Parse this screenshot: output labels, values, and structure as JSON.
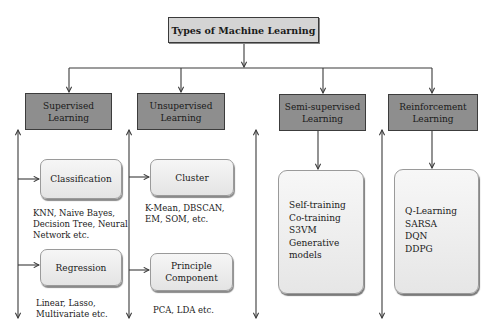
{
  "title": "Types of Machine Learning",
  "categories": [
    {
      "label": "Supervised\nLearning",
      "subtypes": [
        {
          "label": "Classification",
          "examples": "KNN, Naive Bayes,\nDecision Tree, Neural\nNetwork etc."
        },
        {
          "label": "Regression",
          "examples": "Linear, Lasso,\nMultivariate etc."
        }
      ]
    },
    {
      "label": "Unsupervised\nLearning",
      "subtypes": [
        {
          "label": "Cluster",
          "examples": "K-Mean, DBSCAN,\nEM, SOM, etc."
        },
        {
          "label": "Principle\nComponent",
          "examples": "PCA, LDA etc."
        }
      ]
    },
    {
      "label": "Semi-supervised\nLearning",
      "methods": [
        "Self-training",
        "Co-training",
        "S3VM",
        "Generative",
        "models"
      ]
    },
    {
      "label": "Reinforcement\nLearning",
      "methods": [
        "Q-Learning",
        "SARSA",
        "DQN",
        "DDPG"
      ]
    }
  ],
  "colors": {
    "title_fill": "#d4d4d4",
    "category_fill": "#8e8e8e",
    "subtype_fill": "#eeeeee",
    "line": "#3a3a3a"
  }
}
